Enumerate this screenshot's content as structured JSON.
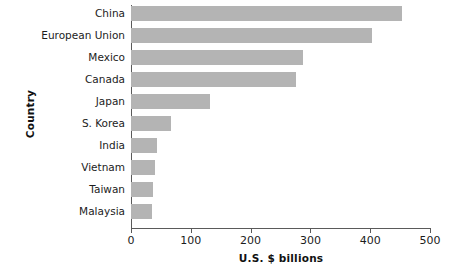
{
  "chart_data": {
    "type": "bar",
    "orientation": "horizontal",
    "title": "",
    "xlabel": "U.S. $ billions",
    "ylabel": "Country",
    "categories": [
      "China",
      "European Union",
      "Mexico",
      "Canada",
      "Japan",
      "S. Korea",
      "India",
      "Vietnam",
      "Taiwan",
      "Malaysia"
    ],
    "values": [
      453,
      403,
      288,
      276,
      132,
      67,
      43,
      40,
      37,
      35
    ],
    "xlim": [
      0,
      500
    ],
    "xticks": [
      0,
      100,
      200,
      300,
      400,
      500
    ],
    "xtick_labels": [
      "0",
      "100",
      "200",
      "300",
      "400",
      "500"
    ],
    "grid": false,
    "legend": false,
    "bar_color": "#b4b4b4",
    "axis_color": "#5a5a5a",
    "text_color": "#1c1c1c"
  }
}
